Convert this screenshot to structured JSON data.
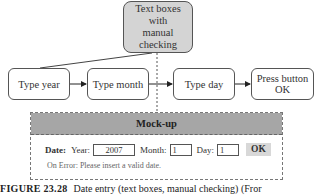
{
  "diagram": {
    "top_node": {
      "label": "Text boxes with manual checking"
    },
    "flow": [
      {
        "label": "Type year"
      },
      {
        "label": "Type month"
      },
      {
        "label": "Type day"
      },
      {
        "label": "Press button OK"
      }
    ],
    "colors": {
      "top_node_fill": "#d4d4d4",
      "mock_header_fill": "#a6a6a6",
      "ok_button_fill": "#d8d8d8"
    }
  },
  "mockup": {
    "title": "Mock-up",
    "date_label": "Date:",
    "year_label": "Year:",
    "year_value": "2007",
    "month_label": "Month:",
    "month_value": "1",
    "day_label": "Day:",
    "day_value": "1",
    "ok_label": "OK",
    "error_text": "On Error: Please insert a valid date."
  },
  "caption": {
    "figure": "FIGURE 23.28",
    "text": "Date entry (text boxes, manual checking) (Fror"
  }
}
